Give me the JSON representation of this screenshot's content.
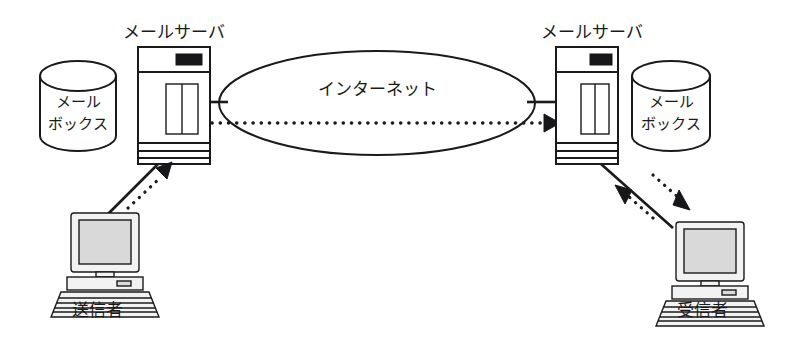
{
  "diagram": {
    "background_color": "#ffffff",
    "line_color": "#1a1a1a",
    "screen_color": "#d9d9d9",
    "nodes": {
      "left_mailbox_label_line1": "メール",
      "left_mailbox_label_line2": "ボックス",
      "left_server_label": "メールサーバ",
      "cloud_label": "インターネット",
      "right_server_label": "メールサーバ",
      "right_mailbox_label_line1": "メール",
      "right_mailbox_label_line2": "ボックス",
      "sender_label": "送信者",
      "receiver_label": "受信者"
    },
    "icons": {
      "left_mailbox": "database-cylinder-icon",
      "left_server": "server-tower-icon",
      "cloud": "internet-ellipse-icon",
      "right_server": "server-tower-icon",
      "right_mailbox": "database-cylinder-icon",
      "sender_computer": "desktop-computer-icon",
      "receiver_computer": "desktop-computer-icon"
    },
    "connections": [
      {
        "name": "sender-to-left-server-solid",
        "style": "solid",
        "arrow": "none"
      },
      {
        "name": "sender-to-left-server-dotted",
        "style": "dotted",
        "arrow": "to-server"
      },
      {
        "name": "left-server-to-cloud-solid",
        "style": "solid",
        "arrow": "none"
      },
      {
        "name": "cloud-crossing-dotted",
        "style": "dotted",
        "arrow": "to-right-server"
      },
      {
        "name": "right-server-to-cloud-solid",
        "style": "solid",
        "arrow": "none"
      },
      {
        "name": "right-server-to-receiver-solid",
        "style": "solid",
        "arrow": "none"
      },
      {
        "name": "right-server-to-receiver-dotted",
        "style": "dotted",
        "arrow": "to-receiver"
      },
      {
        "name": "receiver-to-right-server-dotted",
        "style": "dotted",
        "arrow": "to-server"
      }
    ]
  }
}
